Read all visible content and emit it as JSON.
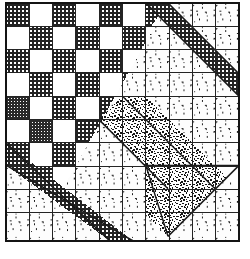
{
  "figure": {
    "caption": "",
    "grid": {
      "rows": 10,
      "cols": 10,
      "cell_px": 23.3
    },
    "colors": {
      "ink": "#1a1a1a",
      "paper": "#ffffff",
      "dark_fill": "#2b2b2b",
      "mid_fill": "#585858",
      "light_fill": "#fbfbfb",
      "grid_line": "#222222"
    },
    "regions": [
      {
        "name": "checkerboard-quadrant",
        "fill": "dark-crosshatch / white alternating",
        "extent": "upper-left, bounded by anti-diagonal"
      },
      {
        "name": "dotted-triangle-field",
        "fill": "white with scattered triangle motifs",
        "extent": "upper-right and lower-left and lower-right"
      },
      {
        "name": "dark-solid-triangles",
        "fill": "dark crosshatch",
        "extent": "diagonal border wedges"
      },
      {
        "name": "dense-stipple-band",
        "fill": "heavy stipple",
        "extent": "diagonal sash from upper-middle to lower-right"
      },
      {
        "name": "dense-stipple-triangle",
        "fill": "heavy stipple",
        "extent": "lower-right triangle"
      }
    ]
  },
  "legend": {
    "items": [
      {
        "swatch": "dark-crosshatch",
        "label": ""
      },
      {
        "swatch": "white-plain",
        "label": ""
      },
      {
        "swatch": "triangle-print",
        "label": ""
      },
      {
        "swatch": "dense-stipple",
        "label": ""
      }
    ]
  }
}
